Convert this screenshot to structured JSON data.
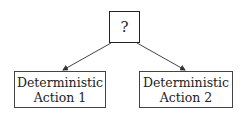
{
  "diagram": {
    "type": "tree",
    "root": {
      "label": "?"
    },
    "children": [
      {
        "line1": "Deterministic",
        "line2": "Action 1"
      },
      {
        "line1": "Deterministic",
        "line2": "Action 2"
      }
    ],
    "edges": [
      {
        "from": "root",
        "to": "children.0",
        "style": "arrow"
      },
      {
        "from": "root",
        "to": "children.1",
        "style": "arrow"
      }
    ],
    "colors": {
      "stroke": "#222222",
      "background": "#ffffff"
    }
  }
}
